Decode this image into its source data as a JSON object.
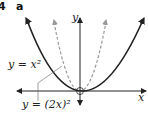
{
  "question": {
    "number": "4",
    "part": "a"
  },
  "axes": {
    "x_label": "x",
    "y_label": "y"
  },
  "curves": [
    {
      "name": "y = x^2",
      "label": "y = x²",
      "style": "solid",
      "color": "#222222"
    },
    {
      "name": "y = (2x)^2",
      "label": "y = (2x)²",
      "style": "dashed",
      "color": "#999999"
    }
  ],
  "origin_marker": "open-circle"
}
